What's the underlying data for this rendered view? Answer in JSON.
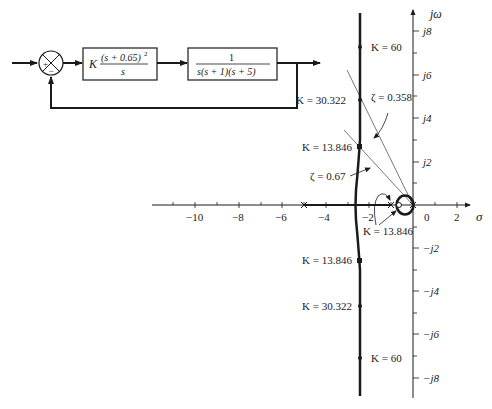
{
  "block_diagram": {
    "summing_junction": {
      "plus_sign": "+",
      "minus_sign": "−"
    },
    "controller": {
      "gain": "K",
      "numerator": "(s + 0.65)",
      "exponent": "2",
      "denominator": "s"
    },
    "plant": {
      "numerator": "1",
      "denominator": "s(s + 1)(s + 5)"
    }
  },
  "root_locus": {
    "axes": {
      "x_label": "σ",
      "y_label": "jω",
      "x_ticks": [
        {
          "value": -10,
          "label": "−10"
        },
        {
          "value": -8,
          "label": "−8"
        },
        {
          "value": -6,
          "label": "−6"
        },
        {
          "value": -4,
          "label": "−4"
        },
        {
          "value": -2,
          "label": "−2"
        },
        {
          "value": 0,
          "label": "0"
        },
        {
          "value": 2,
          "label": "2"
        }
      ],
      "y_ticks": [
        {
          "value": 8,
          "label": "j8"
        },
        {
          "value": 6,
          "label": "j6"
        },
        {
          "value": 4,
          "label": "j4"
        },
        {
          "value": 2,
          "label": "j2"
        },
        {
          "value": -2,
          "label": "−j2"
        },
        {
          "value": -4,
          "label": "−j4"
        },
        {
          "value": -6,
          "label": "−j6"
        },
        {
          "value": -8,
          "label": "−j8"
        }
      ]
    },
    "annotations": {
      "k60_upper": "K = 60",
      "k30_upper": "K = 30.322",
      "k13_upper": "K = 13.846",
      "k13_real": "K = 13.846",
      "k13_lower": "K = 13.846",
      "k30_lower": "K = 30.322",
      "k60_lower": "K = 60",
      "zeta_0358": "ζ = 0.358",
      "zeta_067": "ζ = 0.67"
    },
    "poles": [
      0,
      -1,
      -5
    ],
    "zeros": [
      -0.65,
      -0.65
    ],
    "colors": {
      "ink": "#1a1a1a",
      "thin_line": "#555555"
    }
  }
}
